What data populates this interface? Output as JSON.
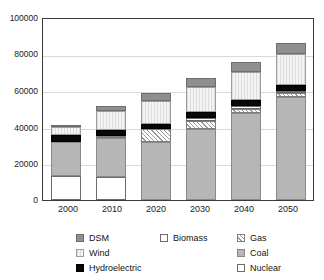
{
  "chart_data": {
    "type": "bar",
    "stacked": true,
    "title": "",
    "subtitle": "",
    "xlabel": "",
    "ylabel": "",
    "categories": [
      "2000",
      "2010",
      "2020",
      "2030",
      "2040",
      "2050"
    ],
    "ylim": [
      0,
      100000
    ],
    "yticks": [
      0,
      20000,
      40000,
      60000,
      80000,
      100000
    ],
    "ytick_labels": [
      "0",
      "20000",
      "40000",
      "60000",
      "80000",
      "100000"
    ],
    "grid": true,
    "legend_position": "bottom",
    "stack_order_bottom_to_top": [
      "Nuclear",
      "Coal",
      "Gas",
      "Biomass",
      "Hydroelectric",
      "Wind",
      "DSM"
    ],
    "series": [
      {
        "name": "Nuclear",
        "swatch": "white-open-square",
        "color": "#ffffff",
        "values": [
          13000,
          12500,
          0,
          0,
          0,
          0
        ]
      },
      {
        "name": "Coal",
        "swatch": "gray-square",
        "color": "#b6b6b6",
        "values": [
          19000,
          22000,
          32000,
          39000,
          48000,
          57000
        ]
      },
      {
        "name": "Gas",
        "swatch": "diagonal-hatch-square",
        "color": "#ffffff",
        "values": [
          0,
          1000,
          7000,
          4500,
          2500,
          2000
        ]
      },
      {
        "name": "Biomass",
        "swatch": "white-open-square",
        "color": "#ffffff",
        "values": [
          0,
          0,
          0,
          2000,
          1500,
          1500
        ]
      },
      {
        "name": "Hydroelectric",
        "swatch": "black-square",
        "color": "#080808",
        "values": [
          4000,
          3000,
          3000,
          3000,
          3500,
          3000
        ]
      },
      {
        "name": "Wind",
        "swatch": "light-striped-square",
        "color": "#e4e4e4",
        "values": [
          4500,
          10500,
          13000,
          14000,
          15000,
          17000
        ]
      },
      {
        "name": "DSM",
        "swatch": "dark-gray-square",
        "color": "#8f8f8f",
        "values": [
          500,
          3000,
          4000,
          5000,
          6000,
          6500
        ]
      }
    ],
    "totals": [
      41000,
      52000,
      59000,
      67500,
      76500,
      87000
    ]
  },
  "legend": {
    "columns": [
      {
        "items": [
          {
            "label": "DSM",
            "swatch": "dsm"
          },
          {
            "label": "Wind",
            "swatch": "wind"
          },
          {
            "label": "Hydroelectric",
            "swatch": "hydro"
          }
        ]
      },
      {
        "items": [
          {
            "label": "Biomass",
            "swatch": "biomass"
          }
        ]
      },
      {
        "items": [
          {
            "label": "Gas",
            "swatch": "gas"
          },
          {
            "label": "Coal",
            "swatch": "coal"
          },
          {
            "label": "Nuclear",
            "swatch": "nuclear"
          }
        ]
      }
    ]
  },
  "colors": {
    "dsm": "#8f8f8f",
    "wind": "#e4e4e4",
    "hydro": "#080808",
    "biomass": "#ffffff",
    "gas": "#ffffff",
    "coal": "#b6b6b6",
    "nuclear": "#ffffff",
    "axis": "#3a3a3a",
    "grid": "#d8d8dd"
  }
}
